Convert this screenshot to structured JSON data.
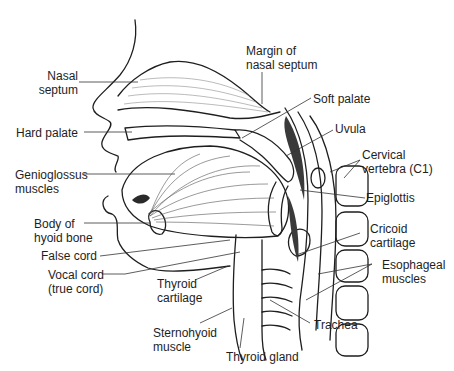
{
  "diagram": {
    "type": "anatomical-illustration",
    "colors": {
      "background": "#ffffff",
      "line": "#1e1e1e",
      "shading": "#555555",
      "dark_fill": "#3a3a3a"
    }
  },
  "labels": {
    "nasal_septum": [
      "Nasal",
      "septum"
    ],
    "margin_of_nasal_septum": [
      "Margin of",
      "nasal septum"
    ],
    "soft_palate": [
      "Soft palate"
    ],
    "hard_palate": [
      "Hard palate"
    ],
    "uvula": [
      "Uvula"
    ],
    "cervical_vertebra": [
      "Cervical",
      "vertebra (C1)"
    ],
    "genioglossus_muscles": [
      "Genioglossus",
      "muscles"
    ],
    "epiglottis": [
      "Epiglottis"
    ],
    "body_of_hyoid_bone": [
      "Body of",
      "hyoid bone"
    ],
    "cricoid_cartilage": [
      "Cricoid",
      "cartilage"
    ],
    "false_cord": [
      "False cord"
    ],
    "vocal_cord": [
      "Vocal cord",
      "(true cord)"
    ],
    "esophageal_muscles": [
      "Esophageal",
      "muscles"
    ],
    "thyroid_cartilage": [
      "Thyroid",
      "cartilage"
    ],
    "sternohyoid_muscle": [
      "Sternohyoid",
      "muscle"
    ],
    "trachea": [
      "Trachea"
    ],
    "thyroid_gland": [
      "Thyroid gland"
    ]
  }
}
